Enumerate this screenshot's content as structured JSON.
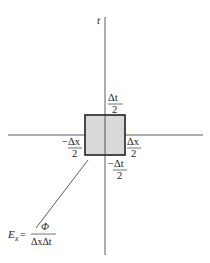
{
  "diagram": {
    "axis_t_label": "t",
    "cell": {
      "fill": "#d6d6d6",
      "stroke": "#222222"
    },
    "labels": {
      "top": {
        "num": "Δt",
        "den": "2"
      },
      "bottom": {
        "sign": "−",
        "num": "Δt",
        "den": "2"
      },
      "left": {
        "sign": "−",
        "num": "Δx",
        "den": "2"
      },
      "right": {
        "num": "Δx",
        "den": "2"
      }
    },
    "formula": {
      "lhs": "E",
      "lhs_sub": "x",
      "equals": "=",
      "num": "Φ",
      "den": "ΔxΔt"
    }
  }
}
